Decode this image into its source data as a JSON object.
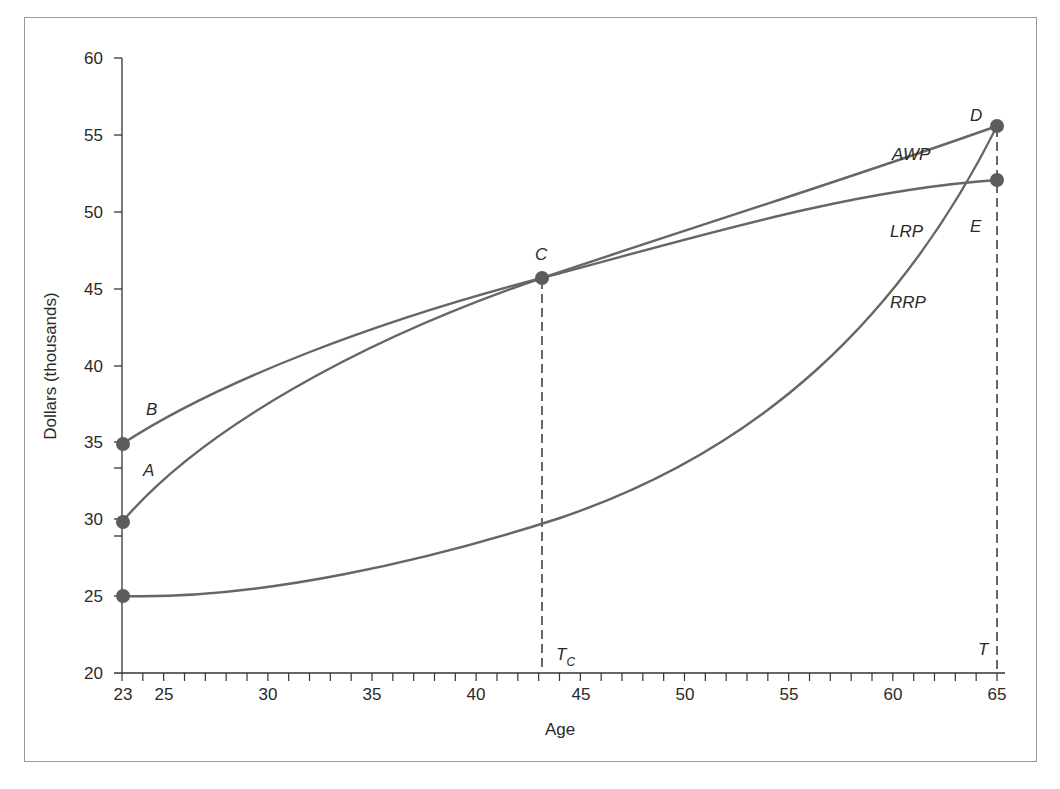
{
  "chart_data": {
    "type": "line",
    "title": "",
    "xlabel": "Age",
    "ylabel": "Dollars (thousands)",
    "xlim": [
      23,
      65
    ],
    "ylim": [
      20,
      60
    ],
    "grid": false,
    "legend": "none (inline curve labels)",
    "x_ticks": [
      "23",
      "25",
      "30",
      "35",
      "40",
      "45",
      "50",
      "55",
      "60",
      "65"
    ],
    "y_ticks": [
      "20",
      "25",
      "30",
      "35",
      "40",
      "45",
      "50",
      "55",
      "60"
    ],
    "series": [
      {
        "name": "AWP",
        "x": [
          23,
          28,
          33,
          38,
          43,
          48,
          53,
          58,
          65
        ],
        "values": [
          30,
          35.2,
          39.2,
          42.7,
          45.7,
          48.1,
          50.3,
          52.0,
          53.7
        ]
      },
      {
        "name": "LRP",
        "x": [
          23,
          28,
          33,
          38,
          43,
          48,
          53,
          58,
          65
        ],
        "values": [
          35,
          38.8,
          41.6,
          43.9,
          45.7,
          47.2,
          48.5,
          49.4,
          50.3
        ]
      },
      {
        "name": "RRP",
        "x": [
          23,
          28,
          33,
          38,
          43,
          48,
          53,
          58,
          65
        ],
        "values": [
          25,
          25.4,
          26.5,
          28.0,
          30.2,
          33.0,
          36.8,
          41.6,
          53.7
        ]
      }
    ],
    "points": [
      {
        "label": "A",
        "x": 23,
        "y": 30
      },
      {
        "label": "B",
        "x": 23,
        "y": 35
      },
      {
        "label": "C",
        "x": 43,
        "y": 45.7
      },
      {
        "label": "D",
        "x": 65,
        "y": 53.7
      },
      {
        "label": "E",
        "x": 65,
        "y": 50.3
      },
      {
        "label": "",
        "x": 23,
        "y": 25
      }
    ],
    "vertical_markers": [
      {
        "label": "T_C",
        "x": 43,
        "style": "dashed"
      },
      {
        "label": "T",
        "x": 65,
        "style": "dashed"
      }
    ],
    "annotations": [
      "A",
      "B",
      "C",
      "D",
      "E",
      "AWP",
      "LRP",
      "RRP",
      "T_C",
      "T"
    ]
  },
  "labels": {
    "xlabel": "Age",
    "ylabel": "Dollars (thousands)",
    "A": "A",
    "B": "B",
    "C": "C",
    "D": "D",
    "E": "E",
    "AWP": "AWP",
    "LRP": "LRP",
    "RRP": "RRP",
    "Tc_main": "T",
    "Tc_sub": "C",
    "T": "T"
  },
  "colors": {
    "curve": "#666666",
    "point": "#5c5c5c",
    "axis": "#333333",
    "frame": "#9a9a9a"
  }
}
